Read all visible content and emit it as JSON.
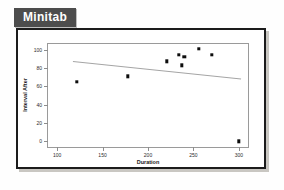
{
  "app": {
    "badge_label": "Minitab"
  },
  "chart_data": {
    "type": "scatter",
    "title": "",
    "xlabel": "Duration",
    "ylabel": "Interval After",
    "xlim": [
      90,
      310
    ],
    "ylim": [
      -6,
      106
    ],
    "xticks": [
      100,
      150,
      200,
      250,
      300
    ],
    "yticks": [
      0,
      20,
      40,
      60,
      80,
      100
    ],
    "grid": false,
    "legend": "none",
    "marker_color": "#0d0d0d",
    "line_color": "#a5a5a5",
    "points": [
      {
        "x": 122,
        "y": 65
      },
      {
        "x": 178,
        "y": 71
      },
      {
        "x": 221,
        "y": 87
      },
      {
        "x": 234,
        "y": 94
      },
      {
        "x": 237,
        "y": 83
      },
      {
        "x": 240,
        "y": 92
      },
      {
        "x": 256,
        "y": 101
      },
      {
        "x": 270,
        "y": 94
      },
      {
        "x": 300,
        "y": 0
      }
    ],
    "fit_line": {
      "name": "regression",
      "x_start": 117,
      "y_start": 87,
      "x_end": 302,
      "y_end": 68
    }
  }
}
